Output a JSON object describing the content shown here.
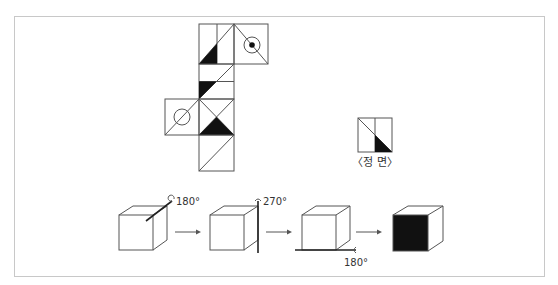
{
  "diagram": {
    "type": "cube-net-rotation-puzzle",
    "colors": {
      "line": "#555555",
      "fill": "#111111",
      "frame": "#c8c8c8"
    },
    "net": {
      "faces": [
        {
          "id": "top-left",
          "pattern": "vertical-line + diagonal bottom-left to top-right + black triangle bottom-left"
        },
        {
          "id": "top-right",
          "pattern": "diagonal top-left to bottom-right + circle with dot"
        },
        {
          "id": "second",
          "pattern": "horizontal line + diagonal top-right to bottom-left + black triangle left"
        },
        {
          "id": "left",
          "pattern": "diagonal + circle"
        },
        {
          "id": "center",
          "pattern": "X diagonals + black triangle bottom"
        },
        {
          "id": "bottom",
          "pattern": "diagonal bottom-left to top-right"
        }
      ]
    },
    "front_view": {
      "label": "〈정 면〉",
      "pattern": "vertical line + diagonal top-left to bottom-right + black triangle bottom-right"
    },
    "rotations": [
      {
        "step": 1,
        "axis": "diagonal-top",
        "angle": "180°"
      },
      {
        "step": 2,
        "axis": "vertical-right",
        "angle": "270°"
      },
      {
        "step": 3,
        "axis": "horizontal-bottom",
        "angle": "180°"
      },
      {
        "step": 4,
        "axis": "result",
        "angle": ""
      }
    ],
    "result_front": "black"
  }
}
